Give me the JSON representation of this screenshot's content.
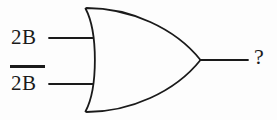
{
  "diagram": {
    "gate": {
      "type": "or-gate",
      "symbol_standard": "distinctive-shape",
      "stroke_color": "#1a1a1a",
      "fill_color": "none",
      "stroke_width": 1.8
    },
    "inputs": [
      {
        "id": "input-a",
        "label": "2B",
        "overbar": false,
        "wire_y": 38
      },
      {
        "id": "input-b",
        "label": "2B",
        "overbar": true,
        "wire_y": 84
      }
    ],
    "output": {
      "id": "output",
      "label": "?",
      "wire_y": 60
    },
    "background_color": "#fdfdfd",
    "text_color": "#1a1a1a"
  }
}
